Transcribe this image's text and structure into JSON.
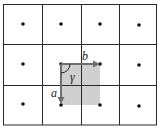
{
  "diagram": {
    "type": "2D lattice with unit cell",
    "grid": {
      "columns": 4,
      "rows": 3,
      "line_color": "#2a2a2a"
    },
    "lattice_points": [
      {
        "col": 0,
        "row": 0
      },
      {
        "col": 1,
        "row": 0
      },
      {
        "col": 2,
        "row": 0
      },
      {
        "col": 3,
        "row": 0
      },
      {
        "col": 0,
        "row": 1
      },
      {
        "col": 1,
        "row": 1
      },
      {
        "col": 2,
        "row": 1
      },
      {
        "col": 3,
        "row": 1
      },
      {
        "col": 0,
        "row": 2
      },
      {
        "col": 1,
        "row": 2
      },
      {
        "col": 2,
        "row": 2
      },
      {
        "col": 3,
        "row": 2
      }
    ],
    "unit_cell": {
      "fill": "#cfcfcf",
      "origin": {
        "col": 1,
        "row": 1
      }
    },
    "vectors": {
      "a": {
        "label": "a",
        "direction": "down",
        "color": "#6e6e6e"
      },
      "b": {
        "label": "b",
        "direction": "right",
        "color": "#6e6e6e"
      }
    },
    "angle": {
      "label": "γ"
    }
  }
}
